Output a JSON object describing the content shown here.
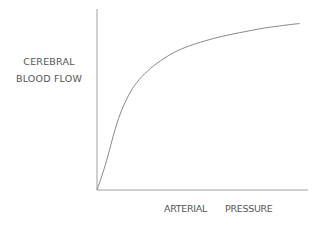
{
  "chart_data": {
    "type": "line",
    "title": "",
    "xlabel": "ARTERIAL PRESSURE",
    "ylabel": "CEREBRAL BLOOD FLOW",
    "ylabel_lines": [
      "CEREBRAL",
      "BLOOD FLOW"
    ],
    "xlabel_words": [
      "ARTERIAL",
      "PRESSURE"
    ],
    "grid": false,
    "legend": null,
    "axis_ticks": "none",
    "xlim": [
      0,
      1
    ],
    "ylim": [
      0,
      1
    ],
    "series": [
      {
        "name": "cerebral blood flow vs arterial pressure (saturating curve)",
        "x": [
          0.0,
          0.04,
          0.11,
          0.2,
          0.35,
          0.53,
          0.77,
          0.96
        ],
        "y": [
          0.0,
          0.14,
          0.42,
          0.61,
          0.75,
          0.83,
          0.89,
          0.92
        ]
      }
    ],
    "colors": {
      "line": "#888888",
      "axis": "#999999",
      "text": "#555555"
    }
  }
}
